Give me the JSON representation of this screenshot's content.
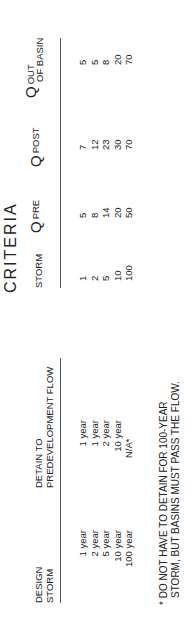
{
  "title": "CRITERIA",
  "left_table": {
    "headers": [
      "DESIGN\nSTORM",
      "DETAIN TO\nPREDEVELOPMENT FLOW"
    ],
    "header_design_1": "DESIGN",
    "header_design_2": "STORM",
    "header_detain_1": "DETAIN TO",
    "header_detain_2": "PREDEVELOPMENT FLOW",
    "rows": [
      {
        "design_storm": "1 year",
        "detain_to": "1 year"
      },
      {
        "design_storm": "2 year",
        "detain_to": "1 year"
      },
      {
        "design_storm": "5 year",
        "detain_to": "2 year"
      },
      {
        "design_storm": "10 year",
        "detain_to": "10 year"
      },
      {
        "design_storm": "100 year",
        "detain_to": "N/A*"
      }
    ]
  },
  "right_table": {
    "header_storm": "STORM",
    "header_qpre": "PRE",
    "header_qpost": "POST",
    "header_qout_1": "OUT",
    "header_qout_2": "OF BASIN",
    "q_symbol": "Q",
    "rows": [
      {
        "storm": "1",
        "q_pre": "5",
        "q_post": "7",
        "q_out": "5"
      },
      {
        "storm": "2",
        "q_pre": "8",
        "q_post": "12",
        "q_out": "5"
      },
      {
        "storm": "5",
        "q_pre": "14",
        "q_post": "23",
        "q_out": "8"
      },
      {
        "storm": "10",
        "q_pre": "20",
        "q_post": "30",
        "q_out": "20"
      },
      {
        "storm": "100",
        "q_pre": "50",
        "q_post": "70",
        "q_out": "70"
      }
    ]
  },
  "footnote_line1": "* DO NOT HAVE TO DETAIN FOR 100-YEAR",
  "footnote_line2": "STORM, BUT BASINS MUST PASS THE FLOW."
}
